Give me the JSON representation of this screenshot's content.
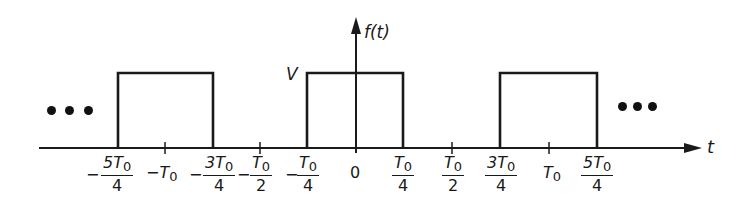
{
  "figure": {
    "function_label": "f(t)",
    "amplitude_label": "V",
    "time_axis_label": "t",
    "continuation_symbol": "• • •",
    "stroke_color": "#1a1a1a",
    "background_color": "#ffffff"
  },
  "axis_ticks": [
    {
      "id": "neg5T0over4",
      "sign": "−",
      "numerator": "5T",
      "subscript": "0",
      "denominator": "4",
      "type": "fraction",
      "pulse_edge": true
    },
    {
      "id": "negT0",
      "sign": "−",
      "text": "T",
      "subscript": "0",
      "type": "plain",
      "pulse_edge": false
    },
    {
      "id": "neg3T0over4",
      "sign": "−",
      "numerator": "3T",
      "subscript": "0",
      "denominator": "4",
      "type": "fraction",
      "pulse_edge": true
    },
    {
      "id": "negT0over2",
      "sign": "−",
      "numerator": "T",
      "subscript": "0",
      "denominator": "2",
      "type": "fraction",
      "pulse_edge": false
    },
    {
      "id": "negT0over4",
      "sign": "−",
      "numerator": "T",
      "subscript": "0",
      "denominator": "4",
      "type": "fraction",
      "pulse_edge": true
    },
    {
      "id": "zero",
      "text": "0",
      "type": "plain",
      "pulse_edge": false
    },
    {
      "id": "T0over4",
      "numerator": "T",
      "subscript": "0",
      "denominator": "4",
      "type": "fraction",
      "pulse_edge": true
    },
    {
      "id": "T0over2",
      "numerator": "T",
      "subscript": "0",
      "denominator": "2",
      "type": "fraction",
      "pulse_edge": false
    },
    {
      "id": "3T0over4",
      "numerator": "3T",
      "subscript": "0",
      "denominator": "4",
      "type": "fraction",
      "pulse_edge": true
    },
    {
      "id": "T0",
      "text": "T",
      "subscript": "0",
      "type": "plain",
      "pulse_edge": false
    },
    {
      "id": "5T0over4",
      "numerator": "5T",
      "subscript": "0",
      "denominator": "4",
      "type": "fraction",
      "pulse_edge": true
    }
  ],
  "pulses": [
    {
      "start": "-5T0/4",
      "end": "-3T0/4",
      "height": "V"
    },
    {
      "start": "-T0/4",
      "end": "T0/4",
      "height": "V"
    },
    {
      "start": "3T0/4",
      "end": "5T0/4",
      "height": "V"
    }
  ]
}
